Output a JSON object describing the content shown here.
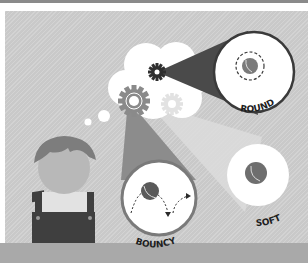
{
  "illustration": {
    "subject": "person thinking about ball properties",
    "concepts": [
      {
        "id": "round",
        "label": "ROUND"
      },
      {
        "id": "bouncy",
        "label": "BOUNCY"
      },
      {
        "id": "soft",
        "label": "SOFT"
      }
    ]
  },
  "colors": {
    "background": "#c9c9c9",
    "dark": "#3a3a3a",
    "cloud": "#ffffff",
    "hair": "#7a7a7a",
    "face": "#b5b5b5",
    "overalls": "#3f3f3f",
    "bottom_bar": "#a9a9a9"
  }
}
